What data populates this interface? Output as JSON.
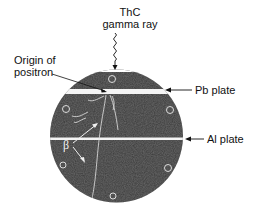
{
  "figure": {
    "source_label": "ThC",
    "source_sublabel": "gamma ray",
    "origin_label_line1": "Origin of",
    "origin_label_line2": "positron",
    "pb_plate_label": "Pb plate",
    "al_plate_label": "Al plate",
    "beta_label": "β",
    "colors": {
      "chamber_fill": "#3a3a3a",
      "plate": "#f2f2f2",
      "text": "#111111",
      "track": "#e8e8e8"
    }
  }
}
